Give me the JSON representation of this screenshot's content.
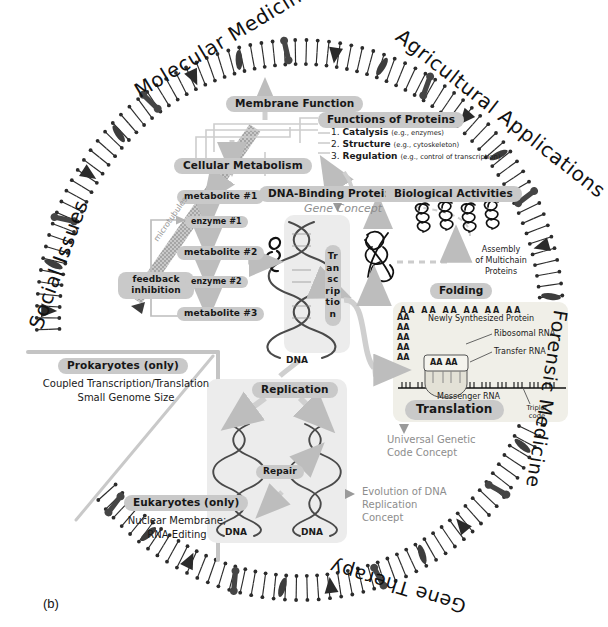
{
  "figure": {
    "caption": "(b)",
    "background": "#ffffff",
    "pill_color": "#c9c9c9",
    "panel_color": "#ececec",
    "arrow_color": "#bdbdbd",
    "membrane_color": "#2b2b2b"
  },
  "ring_labels": [
    {
      "name": "social-issues",
      "text": "Social Issues"
    },
    {
      "name": "molecular-medicine",
      "text": "Molecular Medicine"
    },
    {
      "name": "agricultural-applications",
      "text": "Agricultural Applications"
    },
    {
      "name": "forensic-medicine",
      "text": "Forensic Medicine"
    },
    {
      "name": "gene-therapy",
      "text": "Gene Therapy"
    }
  ],
  "pills": {
    "membrane_function": "Membrane Function",
    "cellular_metabolism": "Cellular Metabolism",
    "functions_of_proteins": "Functions of Proteins",
    "dna_binding_proteins": "DNA-Binding Proteins",
    "biological_activities": "Biological Activities",
    "transcription": "Transcription",
    "replication": "Replication",
    "repair": "Repair",
    "translation": "Translation",
    "folding": "Folding",
    "prokaryotes": "Prokaryotes (only)",
    "eukaryotes": "Eukaryotes (only)",
    "feedback_inhibition": "feedback\ninhibition",
    "metabolite_1": "metabolite #1",
    "enzyme_1": "enzyme #1",
    "metabolite_2": "metabolite #2",
    "enzyme_2": "enzyme #2",
    "metabolite_3": "metabolite #3"
  },
  "protein_functions": [
    {
      "num": "1.",
      "name": "Catalysis",
      "example": "(e.g., enzymes)"
    },
    {
      "num": "2.",
      "name": "Structure",
      "example": "(e.g., cytoskeleton)"
    },
    {
      "num": "3.",
      "name": "Regulation",
      "example": "(e.g., control of transcription)"
    }
  ],
  "concepts": {
    "gene_concept": "Gene Concept",
    "universal_genetic_code": "Universal Genetic\nCode Concept",
    "evolution_dna_replication": "Evolution of DNA\nReplication\nConcept"
  },
  "annotations": {
    "microtubules": "microtubules",
    "assembly_multichain": "Assembly\nof Multichain\nProteins",
    "dna_transcription": "DNA",
    "dna_replication_left": "DNA",
    "dna_replication_right": "DNA"
  },
  "translation_inset": {
    "aa_top_row": [
      "AA",
      "AA",
      "AA",
      "AA",
      "AA",
      "AA",
      "AA"
    ],
    "aa_left_col": [
      "AA",
      "AA",
      "AA",
      "AA",
      "AA"
    ],
    "ribosome_site": "AA AA",
    "newly_synthesized_protein": "Newly Synthesized Protein",
    "ribosomal_rna": "Ribosomal RNA",
    "transfer_rna": "Transfer RNA",
    "messenger_rna": "Messenger RNA",
    "triplet_code": "Triplet\ncode"
  },
  "cell_type_notes": {
    "prokaryotes_lines": [
      "Coupled Transcription/Translation",
      "Small Genome Size"
    ],
    "eukaryotes_lines": [
      "Nuclear Membrane;",
      "RNA Editing"
    ]
  }
}
